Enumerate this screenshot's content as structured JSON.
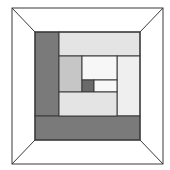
{
  "diagram": {
    "type": "log-cabin-quilt-block",
    "frame": {
      "outer": [
        12,
        8,
        163,
        164
      ],
      "inner": [
        35,
        32,
        140,
        140
      ]
    },
    "colors": {
      "dark": "#7a7a7a",
      "center": "#6a6a6a",
      "medium": "#c6c6c6",
      "light": "#e4e4e4",
      "lighter": "#efefef",
      "white": "#f7f7f7",
      "stroke": "#3a3a3a"
    },
    "pieces": [
      {
        "name": "left-dark-strip",
        "x": 35,
        "y": 32,
        "w": 24,
        "h": 84,
        "fill": "dark"
      },
      {
        "name": "top-light-strip",
        "x": 59,
        "y": 32,
        "w": 81,
        "h": 24,
        "fill": "light"
      },
      {
        "name": "right-light-strip",
        "x": 117,
        "y": 56,
        "w": 23,
        "h": 60,
        "fill": "lighter"
      },
      {
        "name": "bottom-dark-strip",
        "x": 35,
        "y": 116,
        "w": 105,
        "h": 24,
        "fill": "dark"
      },
      {
        "name": "inner-left-gray",
        "x": 59,
        "y": 56,
        "w": 23,
        "h": 36,
        "fill": "medium"
      },
      {
        "name": "inner-top-white",
        "x": 82,
        "y": 56,
        "w": 35,
        "h": 24,
        "fill": "white"
      },
      {
        "name": "center-square",
        "x": 82,
        "y": 80,
        "w": 12,
        "h": 12,
        "fill": "center"
      },
      {
        "name": "inner-right-white",
        "x": 94,
        "y": 80,
        "w": 23,
        "h": 12,
        "fill": "white"
      },
      {
        "name": "inner-bottom-gray",
        "x": 59,
        "y": 92,
        "w": 58,
        "h": 24,
        "fill": "light"
      }
    ]
  }
}
